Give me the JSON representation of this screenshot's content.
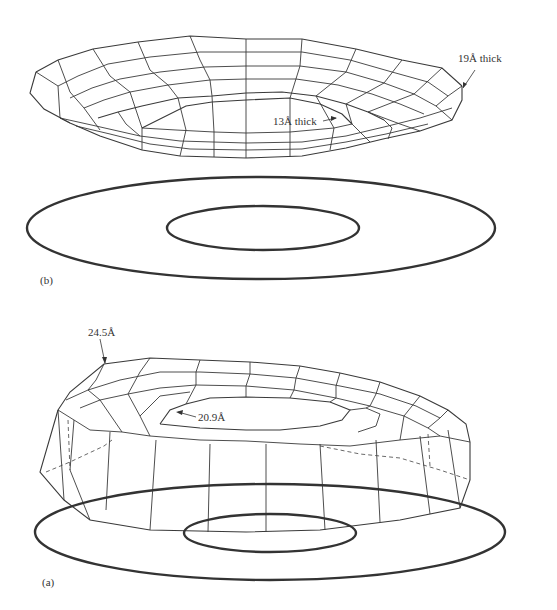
{
  "figure": {
    "panels": [
      {
        "id": "b",
        "label": "(b)",
        "annotations": [
          {
            "text": "19Å thick",
            "points_to": "outer rim"
          },
          {
            "text": "13Å thick",
            "points_to": "inner rim"
          }
        ]
      },
      {
        "id": "a",
        "label": "(a)",
        "annotations": [
          {
            "text": "24.5Å",
            "points_to": "outer rim top"
          },
          {
            "text": "20.9Å",
            "points_to": "inner rim"
          }
        ]
      }
    ]
  },
  "colors": {
    "line": "#333333",
    "background": "#ffffff"
  }
}
